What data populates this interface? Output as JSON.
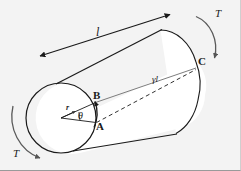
{
  "figure": {
    "type": "engineering-mechanics-diagram",
    "background_color": "#f3f3f3",
    "line_color": "#1a1a1a",
    "width": 241,
    "height": 171
  },
  "labels": {
    "length": "l",
    "radius": "r",
    "angle": "θ",
    "arc": "γl",
    "torque_top_right": "T",
    "torque_bottom_left": "T",
    "point_a": "A",
    "point_b": "B",
    "point_c": "C"
  },
  "semantics": {
    "length_desc": "shaft length l",
    "radius_desc": "shaft radius r",
    "angle_desc": "angle of twist theta",
    "arc_desc": "surface shear displacement gamma times l",
    "torque_desc": "applied torque T at each end",
    "point_a_desc": "undeformed surface point A",
    "point_b_desc": "twisted surface point B",
    "point_c_desc": "far end surface point C"
  },
  "icons": {
    "cylinder": "cylinder-shape",
    "near_circle": "circle-cross-section",
    "far_arc": "ellipse-arc-far-end",
    "dimension_arrow": "double-headed-arrow",
    "torque_arrow_top": "curved-arrow-clockwise",
    "torque_arrow_bottom": "curved-arrow-clockwise",
    "twist_arrow": "curved-arrow-a-to-b",
    "dashed_line": "dashed-helix-line",
    "solid_line": "solid-generator-line"
  }
}
